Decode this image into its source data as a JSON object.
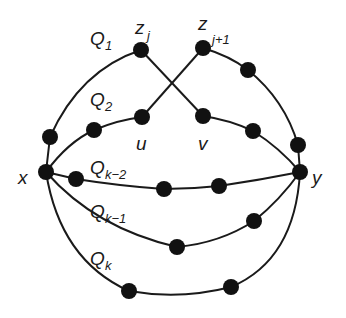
{
  "diagram": {
    "colors": {
      "edge": "#1a1a1a",
      "node": "#111111",
      "background": "#ffffff"
    },
    "endpoints": {
      "x": {
        "label": "x"
      },
      "y": {
        "label": "y"
      }
    },
    "special_vertices": {
      "zj": {
        "main": "z",
        "sub": "j"
      },
      "zj1": {
        "main": "z",
        "sub": "j+1"
      },
      "u": {
        "label": "u"
      },
      "v": {
        "label": "v"
      }
    },
    "paths": [
      {
        "id": "Q1",
        "main": "Q",
        "sub": "1"
      },
      {
        "id": "Q2",
        "main": "Q",
        "sub": "2"
      },
      {
        "id": "Qk-2",
        "main": "Q",
        "sub": "k−2"
      },
      {
        "id": "Qk-1",
        "main": "Q",
        "sub": "k−1"
      },
      {
        "id": "Qk",
        "main": "Q",
        "sub": "k"
      }
    ]
  }
}
